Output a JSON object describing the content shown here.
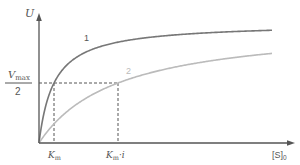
{
  "diagram": {
    "type": "michaelis-menten-competitive-inhibition",
    "y_axis_label": "U",
    "x_axis_label": "[S]",
    "x_axis_label_subscript": "0",
    "vmax_half": {
      "numerator": "V",
      "numerator_subscript": "max",
      "denominator": "2"
    },
    "km_label": "K",
    "km_label_subscript": "m",
    "km_i_label": "K",
    "km_i_label_subscript": "m",
    "km_i_suffix": "·i",
    "curves": [
      {
        "id": "1",
        "label": "1",
        "description": "without inhibitor",
        "color": "#777777"
      },
      {
        "id": "2",
        "label": "2",
        "description": "with competitive inhibitor",
        "color": "#bbbbbb"
      }
    ],
    "colors": {
      "axis": "#555555",
      "dashed": "#555555",
      "text": "#555555"
    }
  },
  "chart_data": {
    "type": "line",
    "title": "",
    "xlabel": "[S]0",
    "ylabel": "U",
    "series": [
      {
        "name": "1",
        "equation": "Vmax*S/(Km+S)",
        "Km_px": 15
      },
      {
        "name": "2",
        "equation": "Vmax*S/(Km*i+S)",
        "Km_px": 79
      }
    ],
    "annotations": [
      "Vmax/2",
      "Km",
      "Km·i"
    ]
  }
}
